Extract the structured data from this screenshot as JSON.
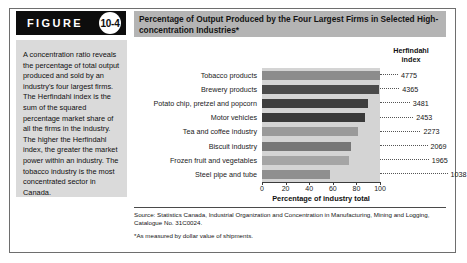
{
  "figure": {
    "badge_word": "FIGURE",
    "badge_number": "10-4"
  },
  "title": "Percentage of Output Produced by the Four Largest Firms in Selected High-concentration Industries*",
  "sidebar": {
    "description": "A concentration ratio reveals the percentage of total output produced and sold by an industry's four largest firms. The Herfindahl index is the sum of the squared percentage market share of all the firms in the industry. The higher the Herfindahl index, the greater the market power within an industry. The tobacco industry is the most concentrated sector in Canada."
  },
  "source": {
    "line1": "Source: Statistics Canada, Industrial Organization and Concentration in Manufacturing, Mining and Logging, Catalogue No. 31C0024.",
    "footnote": "*As measured by dollar value of shipments."
  },
  "chart_data": {
    "type": "bar",
    "orientation": "horizontal",
    "title": "Percentage of Output Produced by the Four Largest Firms in Selected High-concentration Industries*",
    "xlabel": "Percentage of industry total",
    "ylabel": "",
    "xlim": [
      0,
      100
    ],
    "xticks": [
      0,
      20,
      40,
      60,
      80,
      100
    ],
    "xtick_labels": [
      "0",
      "20",
      "40",
      "60",
      "80",
      "100"
    ],
    "grid": false,
    "legend": "none",
    "secondary_column_header": "Herfindahl index",
    "categories": [
      "Tobacco products",
      "Brewery products",
      "Potato chip, pretzel and popcorn",
      "Motor vehicles",
      "Tea and coffee industry",
      "Biscuit industry",
      "Frozen fruit and vegetables",
      "Steel pipe and tube"
    ],
    "values": [
      100,
      99,
      90,
      87,
      81,
      75,
      74,
      58
    ],
    "herfindahl_index": [
      4775,
      4365,
      3481,
      2453,
      2273,
      2069,
      1965,
      1038
    ],
    "bar_colors": [
      "#8c8c8c",
      "#4a4a4a",
      "#3f3f3f",
      "#3a3a3a",
      "#9a9a9a",
      "#777777",
      "#a5a5a5",
      "#8f8f8f"
    ],
    "plot_background": "#d4d4d4"
  },
  "colors": {
    "badge_background": "#0d0d0d",
    "title_band": "#b4b4b4",
    "sidebar_panel": "#dadada",
    "frame_border": "#6e6e6e"
  }
}
